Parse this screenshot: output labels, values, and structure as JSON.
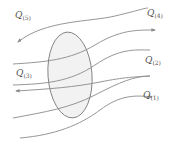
{
  "diagram": {
    "type": "flow-lines-through-control-volume",
    "colors": {
      "line": "#8a8a8a",
      "ellipse_stroke": "#7a7a7a",
      "ellipse_fill": "#f2f2f2",
      "label": "#555555"
    },
    "control_volume": {
      "shape": "ellipse",
      "cx": 70,
      "cy": 75,
      "rx": 22,
      "ry": 43
    },
    "labels": [
      {
        "id": "q5",
        "symbol": "Q",
        "subscript": "(5)",
        "x": 15,
        "y": 19
      },
      {
        "id": "q4",
        "symbol": "Q",
        "subscript": "(4)",
        "x": 147,
        "y": 17
      },
      {
        "id": "q3",
        "symbol": "Q",
        "subscript": "(3)",
        "x": 16,
        "y": 77
      },
      {
        "id": "q2",
        "symbol": "Q",
        "subscript": "(2)",
        "x": 145,
        "y": 64
      },
      {
        "id": "q1",
        "symbol": "Q",
        "subscript": "(1)",
        "x": 143,
        "y": 99
      }
    ],
    "flows": [
      {
        "id": "line-q5",
        "arrow": "start",
        "path": "M18 42 C45 20, 90 22, 115 16 S 145 8, 148 8"
      },
      {
        "id": "line-q4",
        "arrow": "end",
        "path": "M13 64 C45 62, 70 60, 95 45 S 135 30, 155 30"
      },
      {
        "id": "line-unlabeled",
        "arrow": "none",
        "path": "M13 85 C45 84, 70 82, 95 65 S 135 50, 150 50"
      },
      {
        "id": "line-q3",
        "arrow": "start",
        "path": "M16 91 C50 89, 75 87, 100 82 S 135 77, 150 76"
      },
      {
        "id": "line-q2-lower",
        "arrow": "none",
        "path": "M13 118 C45 112, 70 108, 95 95 S 135 76, 150 76"
      },
      {
        "id": "line-q1",
        "arrow": "end",
        "path": "M20 138 C55 135, 80 125, 100 110 S 135 95, 152 97"
      }
    ]
  }
}
